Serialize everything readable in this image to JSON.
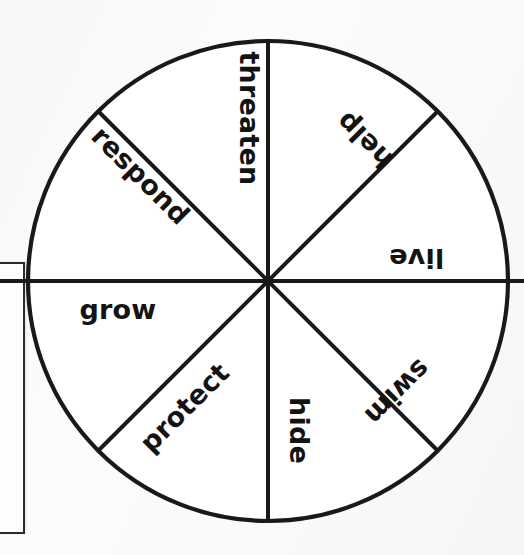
{
  "page": {
    "background_color": "#fbfbfb",
    "ink_color": "#191919"
  },
  "left_box": {
    "name": "cropped-rectangle",
    "border_color": "#2b2b2b"
  },
  "wheel": {
    "title": "",
    "center_x": 268,
    "center_y": 281,
    "radius": 240,
    "segment_count": 8,
    "stroke_color": "#191919",
    "fill_color": "#ffffff",
    "segments": [
      {
        "label": "threaten",
        "rotation_deg": 90,
        "x": 249,
        "y": 118
      },
      {
        "label": "help",
        "rotation_deg": 225,
        "x": 364,
        "y": 140
      },
      {
        "label": "live",
        "rotation_deg": 180,
        "x": 416,
        "y": 258
      },
      {
        "label": "swim",
        "rotation_deg": 135,
        "x": 397,
        "y": 392
      },
      {
        "label": "hide",
        "rotation_deg": 90,
        "x": 299,
        "y": 430
      },
      {
        "label": "protect",
        "rotation_deg": 315,
        "x": 184,
        "y": 407
      },
      {
        "label": "grow",
        "rotation_deg": 0,
        "x": 118,
        "y": 309
      },
      {
        "label": "respond",
        "rotation_deg": 45,
        "x": 141,
        "y": 175
      }
    ]
  }
}
